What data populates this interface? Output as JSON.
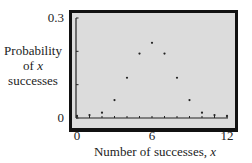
{
  "chart_data": {
    "type": "scatter",
    "title": "",
    "xlabel": "Number of successes, x",
    "ylabel": "Probability of x successes",
    "x": [
      0,
      1,
      2,
      3,
      4,
      5,
      6,
      7,
      8,
      9,
      10,
      11,
      12
    ],
    "values": [
      0.0002,
      0.0029,
      0.0161,
      0.0537,
      0.1208,
      0.1934,
      0.2256,
      0.1934,
      0.1208,
      0.0537,
      0.0161,
      0.0029,
      0.0002
    ],
    "xlim": [
      0,
      12
    ],
    "ylim": [
      0,
      0.3
    ],
    "x_tick_labels": [
      "0",
      "6",
      "12"
    ],
    "y_tick_labels": [
      "0",
      "0.3"
    ],
    "grid": false,
    "legend": null
  },
  "labels": {
    "y_line1": "Probability",
    "y_line2_prefix": "of ",
    "y_line2_var": "x",
    "y_line3": "successes",
    "x_prefix": "Number of successes, ",
    "x_var": "x",
    "ytick_top": "0.3",
    "ytick_bottom": "0",
    "xtick_0": "0",
    "xtick_6": "6",
    "xtick_12": "12"
  },
  "colors": {
    "plot_bg": "#dcdcdc",
    "frame": "#111111",
    "point": "#222222"
  }
}
